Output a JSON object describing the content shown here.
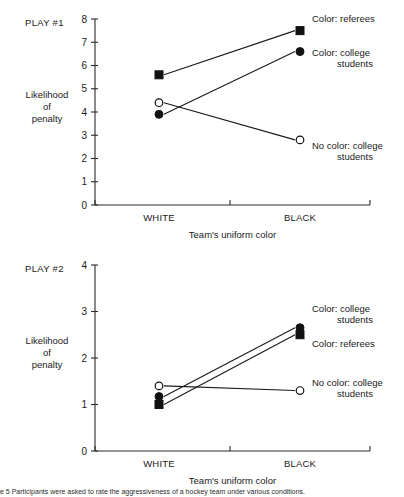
{
  "figure": {
    "caption": "e 5  Participants were asked to rate the aggressiveness of a hockey team under various conditions.",
    "panels": [
      "play1",
      "play2"
    ]
  },
  "chart_data": [
    {
      "id": "play1",
      "type": "line",
      "title": "PLAY #1",
      "xlabel": "Team's uniform color",
      "ylabel_lines": [
        "Likelihood",
        "of",
        "penalty"
      ],
      "categories": [
        "WHITE",
        "BLACK"
      ],
      "yticks": [
        0,
        1,
        2,
        3,
        4,
        5,
        6,
        7,
        8
      ],
      "ylim": [
        0,
        8
      ],
      "grid": false,
      "legend_position": "right-of-points",
      "series": [
        {
          "name": "Color: referees",
          "marker": "filled-square",
          "values": [
            5.6,
            7.5
          ],
          "legend_lines": [
            "Color: referees"
          ]
        },
        {
          "name": "Color: college students",
          "marker": "filled-circle",
          "values": [
            3.9,
            6.6
          ],
          "legend_lines": [
            "Color: college",
            "students"
          ]
        },
        {
          "name": "No color: college students",
          "marker": "open-circle",
          "values": [
            4.4,
            2.8
          ],
          "legend_lines": [
            "No color: college",
            "students"
          ]
        }
      ]
    },
    {
      "id": "play2",
      "type": "line",
      "title": "PLAY #2",
      "xlabel": "Team's uniform color",
      "ylabel_lines": [
        "Likelihood",
        "of",
        "penalty"
      ],
      "categories": [
        "WHITE",
        "BLACK"
      ],
      "yticks": [
        0,
        1,
        2,
        3,
        4
      ],
      "ylim": [
        0,
        4
      ],
      "grid": false,
      "legend_position": "right-of-points",
      "series": [
        {
          "name": "Color: college students",
          "marker": "filled-circle",
          "values": [
            1.17,
            2.65
          ],
          "legend_lines": [
            "Color: college",
            "students"
          ]
        },
        {
          "name": "Color: referees",
          "marker": "filled-square",
          "values": [
            1.0,
            2.5
          ],
          "legend_lines": [
            "Color: referees"
          ]
        },
        {
          "name": "No color: college students",
          "marker": "open-circle",
          "values": [
            1.4,
            1.3
          ],
          "legend_lines": [
            "No color: college",
            "students"
          ]
        }
      ]
    }
  ],
  "colors": {
    "axis": "#2b2b2b",
    "line": "#1a1a1a",
    "marker_fill": "#111111",
    "marker_open": "#ffffff",
    "text": "#1a1a1a",
    "background": "#ffffff"
  }
}
